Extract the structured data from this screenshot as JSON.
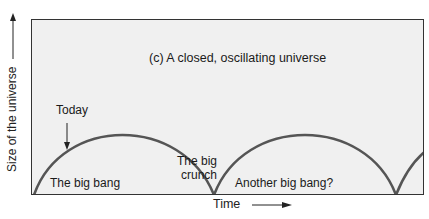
{
  "figure": {
    "title": "(c) A closed, oscillating universe",
    "y_axis_label": "Size of the universe",
    "x_axis_label": "Time",
    "annotations": {
      "today": "Today",
      "big_bang": "The big bang",
      "big_crunch_line1": "The big",
      "big_crunch_line2": "crunch",
      "another_big_bang": "Another big bang?"
    },
    "colors": {
      "background": "#f0f0f0",
      "curve": "#555555",
      "frame": "#333333",
      "bang_glow": "#666666"
    }
  }
}
